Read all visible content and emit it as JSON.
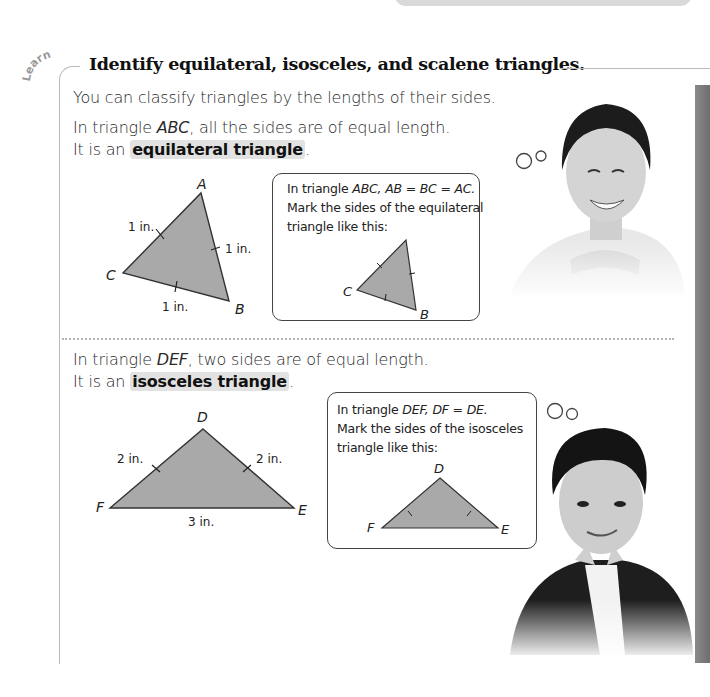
{
  "page": {
    "section_tag": "Learn",
    "title": "Identify equilateral, isosceles, and scalene triangles.",
    "intro": "You can classify triangles by the lengths of their sides."
  },
  "equilateral": {
    "line1_prefix": "In triangle ",
    "line1_name": "ABC",
    "line1_suffix": ", all the sides are of equal length.",
    "line2_prefix": "It is an ",
    "line2_term": "equilateral triangle",
    "line2_suffix": ".",
    "figure": {
      "vertices": {
        "A": "A",
        "B": "B",
        "C": "C"
      },
      "side_labels": {
        "CA": "1 in.",
        "AB": "1 in.",
        "CB": "1 in."
      }
    },
    "note": {
      "line1_prefix": "In triangle ",
      "line1_eq": "ABC, AB = BC = AC.",
      "line2": "Mark the sides of the equilateral",
      "line3": "triangle like this:",
      "vertices": {
        "A": "A",
        "B": "B",
        "C": "C"
      }
    }
  },
  "isosceles": {
    "line1_prefix": "In triangle ",
    "line1_name": "DEF",
    "line1_suffix": ", two sides are of equal length.",
    "line2_prefix": "It is an ",
    "line2_term": "isosceles triangle",
    "line2_suffix": ".",
    "figure": {
      "vertices": {
        "D": "D",
        "E": "E",
        "F": "F"
      },
      "side_labels": {
        "FD": "2 in.",
        "DE": "2 in.",
        "FE": "3 in."
      }
    },
    "note": {
      "line1_prefix": "In triangle ",
      "line1_eq": "DEF, DF = DE.",
      "line2": "Mark the sides of the isosceles",
      "line3": "triangle like this:",
      "vertices": {
        "D": "D",
        "E": "E",
        "F": "F"
      }
    }
  },
  "colors": {
    "triangle_fill": "#a9a9a9",
    "triangle_stroke": "#333333",
    "highlight": "#e2e2e2",
    "side_bar": "#7a7a7a"
  }
}
